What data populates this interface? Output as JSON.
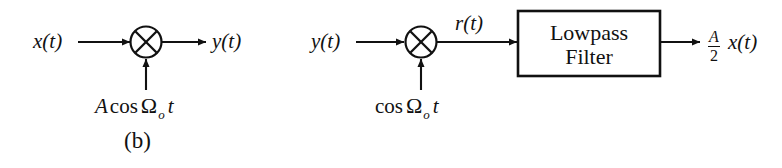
{
  "figure": {
    "caption": "(b)",
    "domain_note": "amplitude modulation / demodulation block diagram"
  },
  "modulator": {
    "name": "modulator-stage",
    "input_label": "x(t)",
    "output_label": "y(t)",
    "multiplier_symbol": "⊗",
    "carrier": {
      "amplitude": "A",
      "function": "cos",
      "omega": "Ω",
      "subscript": "o",
      "variable": "t",
      "full": "A cos Ωₒt"
    }
  },
  "demodulator": {
    "name": "demodulator-stage",
    "input_label": "y(t)",
    "intermediate_label": "r(t)",
    "multiplier_symbol": "⊗",
    "carrier": {
      "amplitude": "",
      "function": "cos",
      "omega": "Ω",
      "subscript": "o",
      "variable": "t",
      "full": "cos Ωₒt"
    },
    "filter": {
      "line1": "Lowpass",
      "line2": "Filter"
    },
    "output": {
      "numerator": "A",
      "denominator": "2",
      "signal": "x(t)",
      "full": "A/2 x(t)"
    }
  },
  "style": {
    "ink": "#111111",
    "background": "#ffffff"
  }
}
